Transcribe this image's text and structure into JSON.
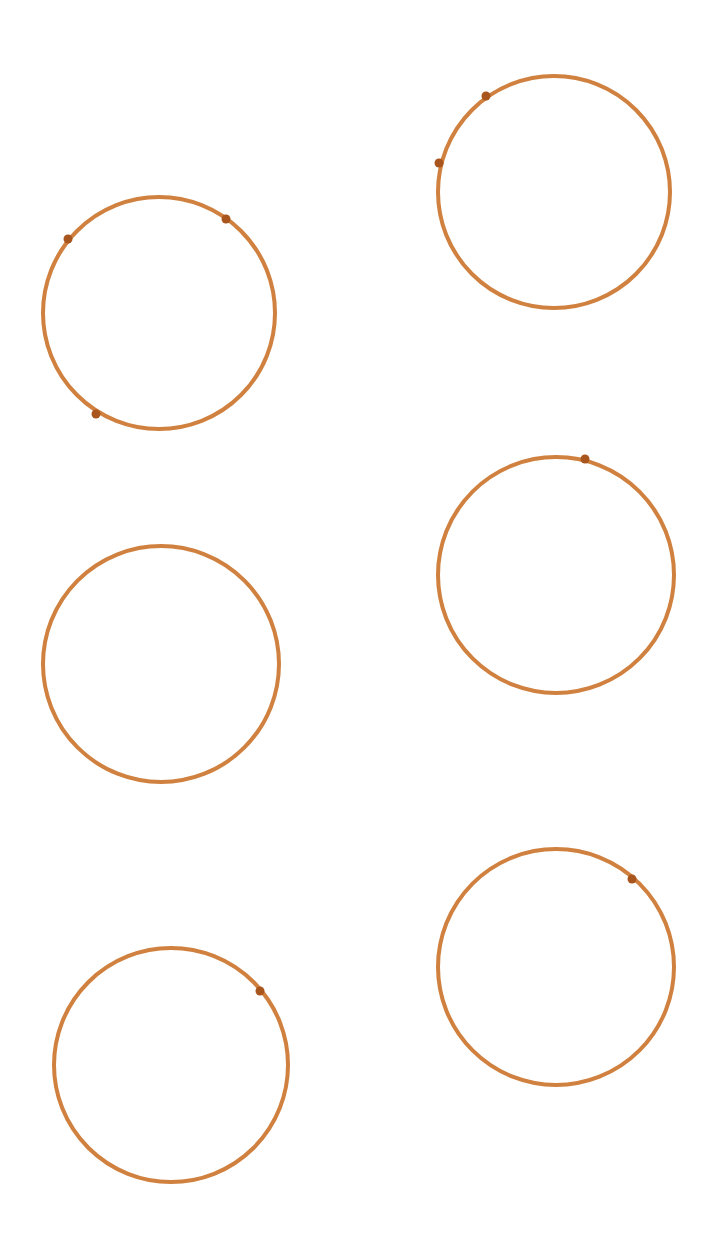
{
  "background": "#ffffff",
  "stroke_color": "#d0813f",
  "dot_color": "#a9561e",
  "circles": [
    {
      "cx": 159,
      "cy": 313,
      "r": 116,
      "dots": [
        [
          68,
          239
        ],
        [
          226,
          219
        ],
        [
          96,
          414
        ]
      ]
    },
    {
      "cx": 554,
      "cy": 192,
      "r": 116,
      "dots": [
        [
          486,
          96
        ],
        [
          439,
          163
        ]
      ]
    },
    {
      "cx": 161,
      "cy": 664,
      "r": 118,
      "dots": []
    },
    {
      "cx": 556,
      "cy": 575,
      "r": 118,
      "dots": [
        [
          585,
          459
        ]
      ]
    },
    {
      "cx": 171,
      "cy": 1065,
      "r": 117,
      "dots": [
        [
          260,
          991
        ]
      ]
    },
    {
      "cx": 556,
      "cy": 967,
      "r": 118,
      "dots": [
        [
          632,
          879
        ]
      ]
    }
  ]
}
